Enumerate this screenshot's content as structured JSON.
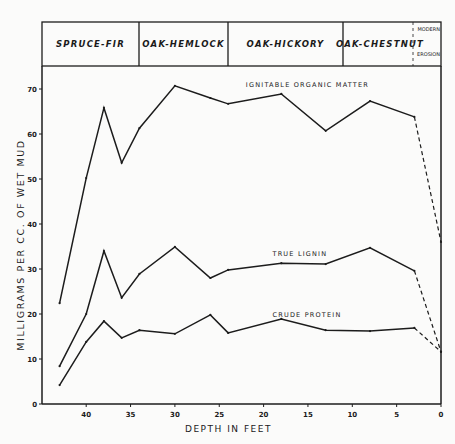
{
  "header_bands": [
    {
      "label": "SPRUCE-FIR",
      "x0": 42,
      "x1": 139
    },
    {
      "label": "OAK-HEMLOCK",
      "x0": 139,
      "x1": 228
    },
    {
      "label": "OAK-HICKORY",
      "x0": 228,
      "x1": 343
    },
    {
      "label": "OAK-CHESTNUT",
      "x0": 343,
      "x1": 413
    },
    {
      "label_top": "MODERN",
      "label_bottom": "EROSION",
      "x0": 413,
      "x1": 441
    }
  ],
  "chart_data": {
    "type": "line",
    "title": "",
    "xlabel": "DEPTH IN FEET",
    "ylabel": "MILLIGRAMS PER CC. OF WET MUD",
    "xlim": [
      43,
      0
    ],
    "ylim": [
      0,
      72
    ],
    "x_ticks": [
      40,
      35,
      30,
      25,
      20,
      15,
      10,
      5,
      0
    ],
    "y_ticks": [
      0,
      10,
      20,
      30,
      40,
      50,
      60,
      70
    ],
    "grid": false,
    "legend": "inline labels",
    "series": [
      {
        "name": "IGNITABLE ORGANIC MATTER",
        "x": [
          43,
          40,
          38,
          36,
          34,
          30,
          26,
          24,
          18,
          13,
          8,
          3,
          0
        ],
        "values": [
          22.4,
          50.2,
          65.8,
          53.6,
          61.3,
          70.7,
          68.0,
          66.7,
          68.9,
          60.7,
          67.3,
          63.8,
          36.0
        ],
        "dashed_from_index": 11
      },
      {
        "name": "TRUE LIGNIN",
        "x": [
          43,
          40,
          38,
          36,
          34,
          30,
          26,
          24,
          18,
          13,
          8,
          3,
          0
        ],
        "values": [
          8.4,
          20.0,
          34.0,
          23.6,
          28.9,
          34.9,
          28.0,
          29.8,
          31.3,
          31.1,
          34.7,
          29.6,
          11.6
        ],
        "dashed_from_index": 11
      },
      {
        "name": "CRUDE PROTEIN",
        "x": [
          43,
          40,
          38,
          36,
          34,
          30,
          26,
          24,
          18,
          13,
          8,
          3,
          0
        ],
        "values": [
          4.2,
          13.8,
          18.4,
          14.7,
          16.4,
          15.6,
          19.8,
          15.8,
          18.9,
          16.4,
          16.2,
          16.9,
          11.6
        ],
        "dashed_from_index": 11
      }
    ],
    "annotations": [
      {
        "text": "IGNITABLE ORGANIC MATTER",
        "x": 22,
        "y": 70.5
      },
      {
        "text": "TRUE LIGNIN",
        "x": 19,
        "y": 32.8
      },
      {
        "text": "CRUDE PROTEIN",
        "x": 19,
        "y": 19.4
      }
    ]
  }
}
